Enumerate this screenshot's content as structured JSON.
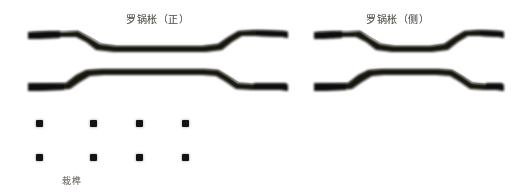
{
  "plate": {
    "width": 516,
    "height": 195,
    "background": "#ffffff",
    "ink_color": "#15120f",
    "caption_color": "#4b4742"
  },
  "captions": {
    "front_view": "罗锅枨（正）",
    "side_view": "罗锅枨（侧）",
    "tenon": "栽榫"
  },
  "figures": [
    {
      "id": "humpback-stretcher-front-upper",
      "label": "罗锅枨（正）",
      "view": "front",
      "position": "upper-left",
      "x": 26,
      "y": 22,
      "width": 262,
      "height": 34
    },
    {
      "id": "humpback-stretcher-front-lower",
      "label": "罗锅枨（正）",
      "view": "front",
      "position": "lower-left",
      "x": 26,
      "y": 64,
      "width": 262,
      "height": 34
    },
    {
      "id": "humpback-stretcher-side-upper",
      "label": "罗锅枨（侧）",
      "view": "side",
      "position": "upper-right",
      "x": 312,
      "y": 22,
      "width": 192,
      "height": 34
    },
    {
      "id": "humpback-stretcher-side-lower",
      "label": "罗锅枨（侧）",
      "view": "side",
      "position": "lower-right",
      "x": 312,
      "y": 64,
      "width": 192,
      "height": 34
    }
  ],
  "tenon_grid": {
    "label": "栽榫",
    "rows": 2,
    "columns": 4,
    "count": 8,
    "chip_size_px": 7,
    "column_offsets_px": [
      6,
      60,
      106,
      152
    ],
    "row_offsets_px": [
      0,
      34
    ]
  }
}
